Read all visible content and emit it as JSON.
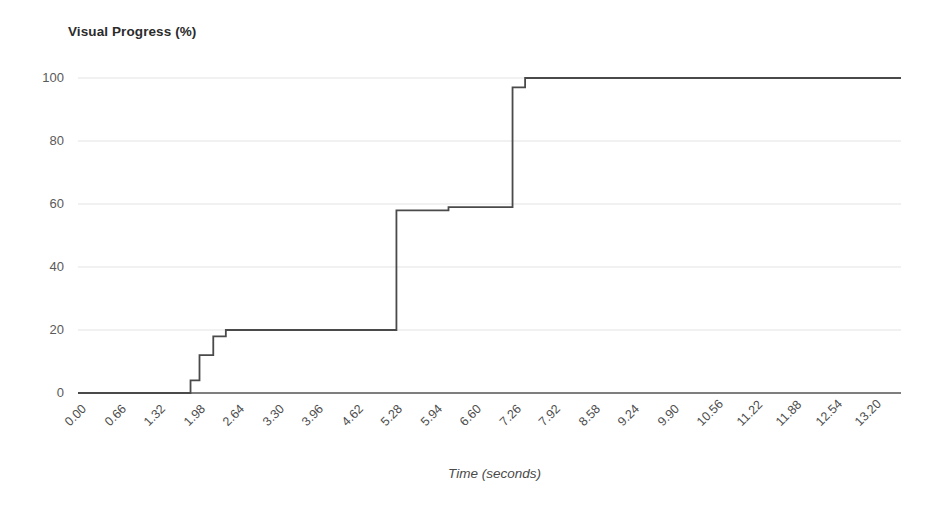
{
  "chart_data": {
    "type": "line",
    "line_style": "step-post",
    "title": "Visual Progress (%)",
    "xlabel": "Time (seconds)",
    "ylabel": "Visual Progress (%)",
    "xlim": [
      0.0,
      13.75
    ],
    "ylim": [
      0,
      100
    ],
    "grid": true,
    "grid_axis": "y",
    "legend": "none",
    "y_ticks": [
      0,
      20,
      40,
      60,
      80,
      100
    ],
    "y_tick_labels": [
      "0",
      "20",
      "40",
      "60",
      "80",
      "100"
    ],
    "x_ticks": [
      0.0,
      0.66,
      1.32,
      1.98,
      2.64,
      3.3,
      3.96,
      4.62,
      5.28,
      5.94,
      6.6,
      7.26,
      7.92,
      8.58,
      9.24,
      9.9,
      10.56,
      11.22,
      11.88,
      12.54,
      13.2
    ],
    "x_tick_labels": [
      "0.00",
      "0.66",
      "1.32",
      "1.98",
      "2.64",
      "3.30",
      "3.96",
      "4.62",
      "5.28",
      "5.94",
      "6.60",
      "7.26",
      "7.92",
      "8.58",
      "9.24",
      "9.90",
      "10.56",
      "11.22",
      "11.88",
      "12.54",
      "13.20"
    ],
    "x_tick_label_rotation": -45,
    "series": [
      {
        "name": "Visual Progress",
        "color": "#4a4a4a",
        "line_width": 1.8,
        "x": [
          0.0,
          1.88,
          1.88,
          2.03,
          2.03,
          2.26,
          2.26,
          2.47,
          2.47,
          5.32,
          5.32,
          6.19,
          6.19,
          7.26,
          7.26,
          7.47,
          7.47,
          13.75
        ],
        "y": [
          0,
          0,
          4,
          4,
          12,
          12,
          18,
          18,
          20,
          20,
          58,
          58,
          59,
          59,
          97,
          97,
          100,
          100
        ]
      }
    ],
    "steps": [
      {
        "time": 0.0,
        "value": 0
      },
      {
        "time": 1.88,
        "value": 4
      },
      {
        "time": 2.03,
        "value": 12
      },
      {
        "time": 2.26,
        "value": 18
      },
      {
        "time": 2.47,
        "value": 20
      },
      {
        "time": 5.32,
        "value": 58
      },
      {
        "time": 6.19,
        "value": 59
      },
      {
        "time": 7.26,
        "value": 97
      },
      {
        "time": 7.47,
        "value": 100
      },
      {
        "time": 13.75,
        "value": 100
      }
    ]
  },
  "style": {
    "line_color": "#4a4a4a",
    "grid_color": "#e3e3e3",
    "axis_color": "#555555",
    "title_color": "#2b2b2b",
    "tick_color": "#5a5a5a",
    "background": "#ffffff"
  }
}
